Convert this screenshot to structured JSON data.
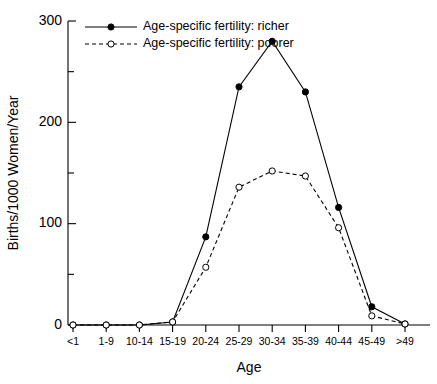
{
  "chart_data": {
    "type": "line",
    "title": "",
    "xlabel": "Age",
    "ylabel": "Births/1000 Women/Year",
    "categories": [
      "<1",
      "1-9",
      "10-14",
      "15-19",
      "20-24",
      "25-29",
      "30-34",
      "35-39",
      "40-44",
      "45-49",
      ">49"
    ],
    "ylim": [
      0,
      300
    ],
    "yticks": [
      0,
      100,
      200,
      300
    ],
    "ytick_labels": [
      "0",
      "100",
      "200",
      "300"
    ],
    "yminorticks": [
      50,
      150,
      250
    ],
    "grid": false,
    "legend_position": "top-left",
    "series": [
      {
        "name": "Age-specific fertility: richer",
        "marker": "filled-circle",
        "linestyle": "solid",
        "color": "#000000",
        "values": [
          0,
          0,
          0,
          3,
          87,
          235,
          280,
          230,
          116,
          18,
          1
        ]
      },
      {
        "name": "Age-specific fertility: poorer",
        "marker": "open-circle",
        "linestyle": "dashed",
        "color": "#000000",
        "values": [
          0,
          0,
          0,
          3,
          57,
          136,
          152,
          147,
          96,
          9,
          1
        ]
      }
    ]
  },
  "legend": {
    "entries": [
      {
        "label": "Age-specific fertility: richer"
      },
      {
        "label": "Age-specific fertility: poorer"
      }
    ]
  },
  "axes": {
    "x_title": "Age",
    "y_title": "Births/1000 Women/Year"
  }
}
